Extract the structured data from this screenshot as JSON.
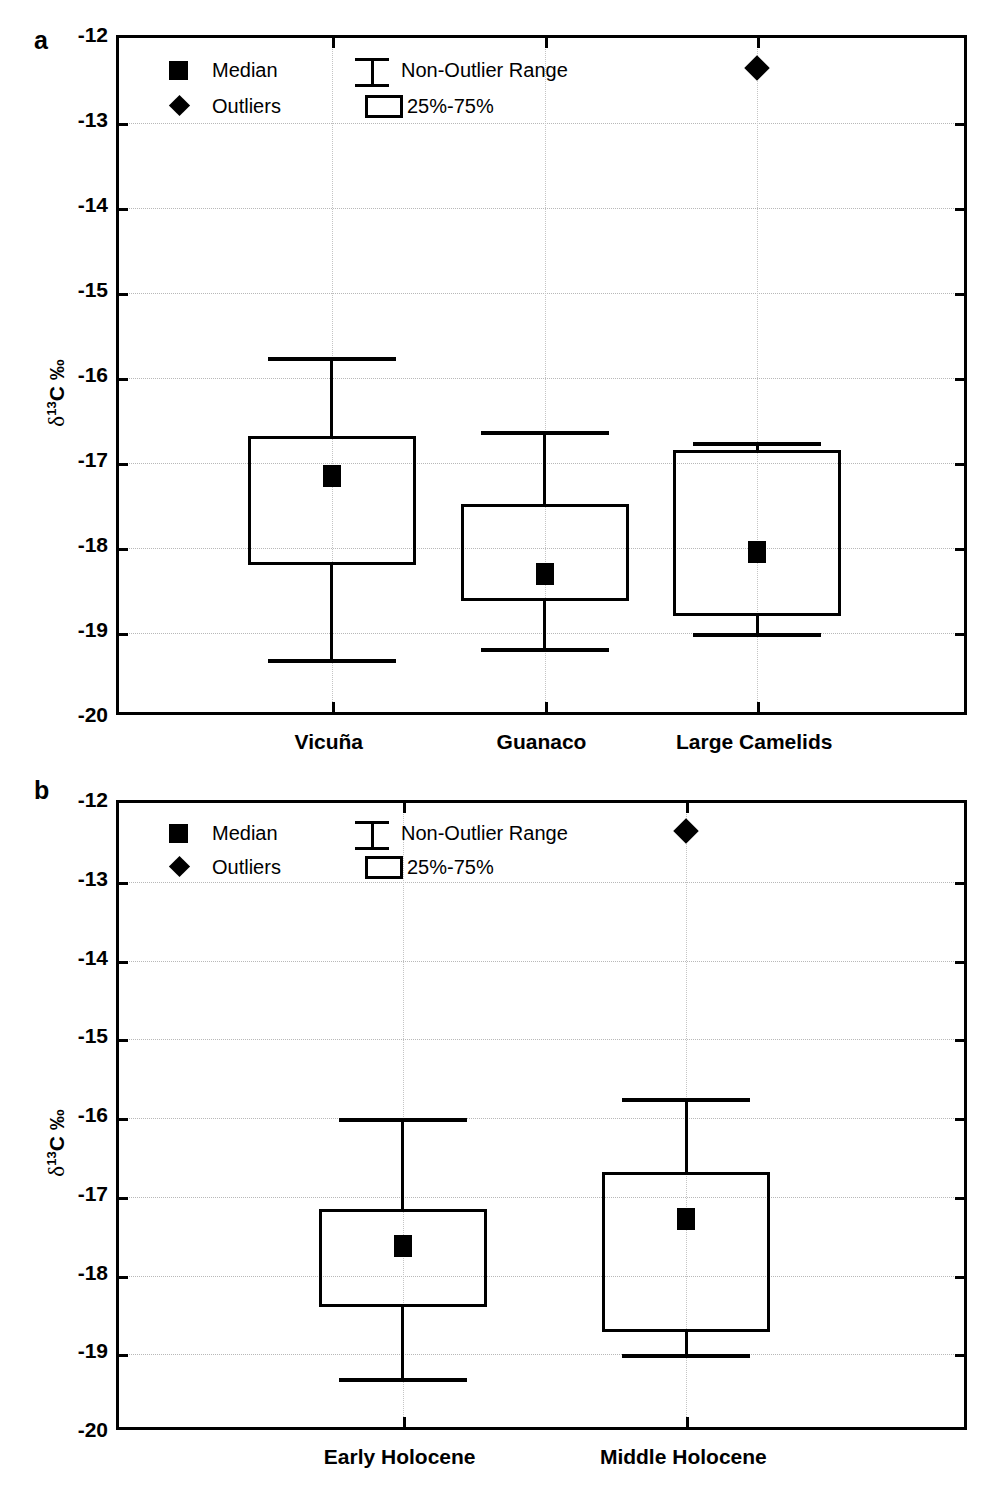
{
  "figure": {
    "background": "#ffffff",
    "ink_color": "#000000",
    "grid_color": "#b8b8b8"
  },
  "panels": [
    {
      "letter": "a",
      "ylabel": "δ13C ‰",
      "ylabel_delta": "δ",
      "ylabel_sup": "13",
      "ylabel_rest": "C ‰",
      "ytick_labels": [
        "-12",
        "-13",
        "-14",
        "-15",
        "-16",
        "-17",
        "-18",
        "-19",
        "-20"
      ],
      "xtick_labels": [
        "Vicuña",
        "Guanaco",
        "Large Camelids"
      ],
      "legend": {
        "median_label": "Median",
        "outliers_label": "Outliers",
        "range_label": "Non-Outlier Range",
        "iqr_label": "25%-75%"
      }
    },
    {
      "letter": "b",
      "ylabel": "δ13C ‰",
      "ylabel_delta": "δ",
      "ylabel_sup": "13",
      "ylabel_rest": "C ‰",
      "ytick_labels": [
        "-12",
        "-13",
        "-14",
        "-15",
        "-16",
        "-17",
        "-18",
        "-19",
        "-20"
      ],
      "xtick_labels": [
        "Early Holocene",
        "Middle Holocene"
      ],
      "legend": {
        "median_label": "Median",
        "outliers_label": "Outliers",
        "range_label": "Non-Outlier Range",
        "iqr_label": "25%-75%"
      }
    }
  ],
  "chart_data": [
    {
      "type": "box",
      "panel": "a",
      "title": "",
      "xlabel": "",
      "ylabel": "δ13C ‰",
      "ylim": [
        -20,
        -12
      ],
      "ytick_values": [
        -12,
        -13,
        -14,
        -15,
        -16,
        -17,
        -18,
        -19,
        -20
      ],
      "grid": true,
      "legend_position": "top-left-inside",
      "categories": [
        "Vicuña",
        "Guanaco",
        "Large Camelids"
      ],
      "boxes": [
        {
          "category": "Vicuña",
          "whisker_high": -15.75,
          "q3": -16.68,
          "median": -17.15,
          "q1": -18.2,
          "whisker_low": -19.3,
          "outliers": []
        },
        {
          "category": "Guanaco",
          "whisker_high": -16.62,
          "q3": -17.48,
          "median": -18.3,
          "q1": -18.62,
          "whisker_low": -19.18,
          "outliers": []
        },
        {
          "category": "Large Camelids",
          "whisker_high": -16.75,
          "q3": -16.85,
          "median": -18.05,
          "q1": -18.8,
          "whisker_low": -19.0,
          "outliers": [
            -12.35
          ]
        }
      ]
    },
    {
      "type": "box",
      "panel": "b",
      "title": "",
      "xlabel": "",
      "ylabel": "δ13C ‰",
      "ylim": [
        -20,
        -12
      ],
      "ytick_values": [
        -12,
        -13,
        -14,
        -15,
        -16,
        -17,
        -18,
        -19,
        -20
      ],
      "grid": true,
      "legend_position": "top-left-inside",
      "categories": [
        "Early Holocene",
        "Middle Holocene"
      ],
      "boxes": [
        {
          "category": "Early Holocene",
          "whisker_high": -16.0,
          "q3": -17.15,
          "median": -17.63,
          "q1": -18.4,
          "whisker_low": -19.3,
          "outliers": []
        },
        {
          "category": "Middle Holocene",
          "whisker_high": -15.75,
          "q3": -16.68,
          "median": -17.28,
          "q1": -18.72,
          "whisker_low": -19.0,
          "outliers": [
            -12.35
          ]
        }
      ]
    }
  ]
}
